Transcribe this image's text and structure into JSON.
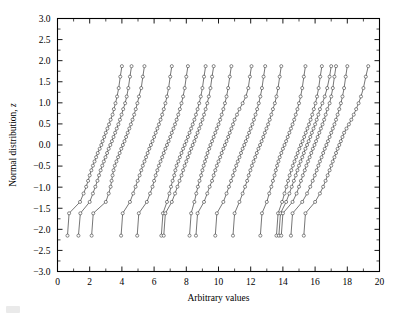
{
  "figure": {
    "name": "normal-probability-plot"
  },
  "axes": {
    "x": {
      "label": "Arbitrary values",
      "min": 0,
      "max": 20,
      "ticks": [
        0,
        2,
        4,
        6,
        8,
        10,
        12,
        14,
        16,
        18,
        20
      ],
      "tick_labels": [
        "0",
        "2",
        "4",
        "6",
        "8",
        "10",
        "12",
        "14",
        "16",
        "18",
        "20"
      ],
      "minor_tick_step": 1
    },
    "y": {
      "label_prefix": "Normal distribution, ",
      "label_symbol": "z",
      "label": "Normal distribution, z",
      "min": -3.0,
      "max": 3.0,
      "ticks": [
        -3.0,
        -2.5,
        -2.0,
        -1.5,
        -1.0,
        -0.5,
        0.0,
        0.5,
        1.0,
        1.5,
        2.0,
        2.5,
        3.0
      ],
      "tick_labels": [
        "-3.0",
        "-2.5",
        "-2.0",
        "-1.5",
        "-1.0",
        "-0.5",
        "0.0",
        "0.5",
        "1.0",
        "1.5",
        "2.0",
        "2.5",
        "3.0"
      ]
    }
  },
  "style": {
    "line_color": "#2b2b2b",
    "marker_fill": "#ffffff",
    "marker_edge": "#2b2b2b",
    "frame_color": "#000000",
    "background": "#ffffff",
    "marker": "open-circle",
    "grid": false,
    "legend": false
  },
  "chart_data": {
    "type": "line",
    "title": "",
    "subtitle": "",
    "xlabel": "Arbitrary values",
    "ylabel": "Normal distribution, z",
    "xlim": [
      0,
      20
    ],
    "ylim": [
      -3.0,
      3.0
    ],
    "grid": false,
    "legend_position": "none",
    "marker": "open-circle",
    "orientation": "quantile-vertical",
    "z_levels": [
      -2.15,
      -1.62,
      -1.35,
      -1.15,
      -0.99,
      -0.85,
      -0.72,
      -0.6,
      -0.49,
      -0.39,
      -0.29,
      -0.19,
      -0.09,
      0.0,
      0.09,
      0.19,
      0.29,
      0.39,
      0.49,
      0.6,
      0.72,
      0.85,
      0.99,
      1.15,
      1.35,
      1.62,
      1.87
    ],
    "series": [
      {
        "name": "Series 1",
        "x": [
          0.62,
          0.72,
          1.4,
          1.62,
          1.78,
          1.9,
          2.0,
          2.1,
          2.2,
          2.3,
          2.4,
          2.5,
          2.62,
          2.72,
          2.8,
          2.9,
          3.0,
          3.1,
          3.2,
          3.3,
          3.42,
          3.5,
          3.6,
          3.7,
          3.8,
          3.9,
          4.0
        ]
      },
      {
        "name": "Series 2",
        "x": [
          1.3,
          1.42,
          2.0,
          2.2,
          2.35,
          2.48,
          2.58,
          2.68,
          2.78,
          2.88,
          2.98,
          3.08,
          3.18,
          3.28,
          3.38,
          3.48,
          3.58,
          3.68,
          3.78,
          3.88,
          3.98,
          4.08,
          4.2,
          4.3,
          4.4,
          4.5,
          4.6
        ]
      },
      {
        "name": "Series 3",
        "x": [
          2.12,
          2.22,
          3.0,
          3.18,
          3.3,
          3.36,
          3.42,
          3.48,
          3.56,
          3.66,
          3.76,
          3.86,
          3.96,
          4.06,
          4.16,
          4.26,
          4.36,
          4.46,
          4.56,
          4.66,
          4.76,
          4.86,
          4.96,
          5.06,
          5.2,
          5.3,
          5.4
        ]
      },
      {
        "name": "Series 4",
        "x": [
          3.95,
          4.05,
          4.5,
          4.7,
          4.85,
          4.98,
          5.1,
          5.2,
          5.3,
          5.4,
          5.5,
          5.6,
          5.7,
          5.8,
          5.9,
          6.0,
          6.1,
          6.2,
          6.3,
          6.4,
          6.5,
          6.6,
          6.7,
          6.8,
          6.9,
          7.0,
          7.1
        ]
      },
      {
        "name": "Series 5",
        "x": [
          4.95,
          5.05,
          5.55,
          5.75,
          5.9,
          6.0,
          6.1,
          6.2,
          6.3,
          6.4,
          6.5,
          6.6,
          6.7,
          6.8,
          6.9,
          7.0,
          7.1,
          7.2,
          7.3,
          7.4,
          7.5,
          7.6,
          7.7,
          7.8,
          7.9,
          8.0,
          8.1
        ]
      },
      {
        "name": "Series 6",
        "x": [
          6.45,
          6.55,
          6.8,
          6.95,
          7.05,
          7.15,
          7.25,
          7.32,
          7.4,
          7.5,
          7.6,
          7.7,
          7.8,
          7.9,
          8.0,
          8.1,
          8.2,
          8.3,
          8.4,
          8.5,
          8.6,
          8.7,
          8.8,
          8.9,
          9.0,
          9.1,
          9.2
        ]
      },
      {
        "name": "Series 7",
        "x": [
          6.6,
          6.7,
          7.1,
          7.3,
          7.45,
          7.58,
          7.7,
          7.8,
          7.9,
          8.0,
          8.1,
          8.2,
          8.3,
          8.4,
          8.5,
          8.6,
          8.7,
          8.8,
          8.9,
          9.0,
          9.1,
          9.2,
          9.3,
          9.4,
          9.5,
          9.6,
          9.7
        ]
      },
      {
        "name": "Series 8",
        "x": [
          8.2,
          8.3,
          8.5,
          8.62,
          8.72,
          8.82,
          8.92,
          9.0,
          9.08,
          9.16,
          9.24,
          9.32,
          9.42,
          9.5,
          9.6,
          9.7,
          9.8,
          9.9,
          10.0,
          10.1,
          10.2,
          10.3,
          10.4,
          10.5,
          10.6,
          10.7,
          10.8
        ]
      },
      {
        "name": "Series 9",
        "x": [
          8.6,
          8.7,
          9.1,
          9.3,
          9.45,
          9.6,
          9.7,
          9.8,
          9.9,
          10.0,
          10.1,
          10.2,
          10.3,
          10.4,
          10.5,
          10.6,
          10.7,
          10.8,
          10.9,
          11.0,
          11.15,
          11.3,
          11.5,
          11.7,
          11.85,
          11.95,
          12.05
        ]
      },
      {
        "name": "Series 10",
        "x": [
          9.8,
          9.9,
          10.3,
          10.5,
          10.65,
          10.78,
          10.9,
          11.0,
          11.1,
          11.2,
          11.3,
          11.4,
          11.5,
          11.6,
          11.7,
          11.8,
          11.9,
          12.0,
          12.1,
          12.2,
          12.3,
          12.4,
          12.5,
          12.6,
          12.7,
          12.8,
          12.9
        ]
      },
      {
        "name": "Series 11",
        "x": [
          10.9,
          11.0,
          11.3,
          11.5,
          11.65,
          11.78,
          11.88,
          11.98,
          12.08,
          12.18,
          12.28,
          12.38,
          12.48,
          12.58,
          12.68,
          12.78,
          12.88,
          12.98,
          13.08,
          13.18,
          13.28,
          13.38,
          13.5,
          13.6,
          13.7,
          13.8,
          13.9
        ]
      },
      {
        "name": "Series 12",
        "x": [
          12.6,
          12.7,
          13.0,
          13.15,
          13.28,
          13.38,
          13.48,
          13.56,
          13.64,
          13.72,
          13.8,
          13.9,
          14.0,
          14.1,
          14.2,
          14.3,
          14.4,
          14.5,
          14.6,
          14.7,
          14.8,
          14.9,
          15.0,
          15.1,
          15.2,
          15.3,
          15.4
        ]
      },
      {
        "name": "Series 13",
        "x": [
          13.6,
          13.7,
          13.95,
          14.1,
          14.22,
          14.32,
          14.42,
          14.52,
          14.62,
          14.72,
          14.82,
          14.92,
          15.02,
          15.12,
          15.22,
          15.32,
          15.42,
          15.52,
          15.62,
          15.72,
          15.82,
          15.92,
          16.02,
          16.12,
          16.22,
          16.32,
          16.42
        ]
      },
      {
        "name": "Series 14",
        "x": [
          13.75,
          13.85,
          14.2,
          14.4,
          14.55,
          14.68,
          14.8,
          14.9,
          15.0,
          15.1,
          15.2,
          15.3,
          15.4,
          15.5,
          15.6,
          15.7,
          15.8,
          15.9,
          16.0,
          16.1,
          16.2,
          16.3,
          16.45,
          16.6,
          16.75,
          16.9,
          17.0
        ]
      },
      {
        "name": "Series 15",
        "x": [
          13.9,
          14.0,
          14.6,
          14.85,
          15.0,
          15.12,
          15.24,
          15.36,
          15.46,
          15.56,
          15.66,
          15.76,
          15.86,
          15.96,
          16.06,
          16.16,
          16.26,
          16.36,
          16.46,
          16.56,
          16.66,
          16.76,
          16.9,
          17.0,
          17.1,
          17.2,
          17.3
        ]
      },
      {
        "name": "Series 16",
        "x": [
          14.5,
          14.6,
          15.2,
          15.5,
          15.7,
          15.85,
          15.98,
          16.1,
          16.2,
          16.3,
          16.4,
          16.5,
          16.6,
          16.7,
          16.8,
          16.9,
          17.0,
          17.1,
          17.2,
          17.3,
          17.4,
          17.5,
          17.6,
          17.7,
          17.8,
          17.9,
          18.0
        ]
      },
      {
        "name": "Series 17",
        "x": [
          15.3,
          15.4,
          16.0,
          16.3,
          16.5,
          16.65,
          16.78,
          16.9,
          17.0,
          17.1,
          17.2,
          17.3,
          17.4,
          17.5,
          17.6,
          17.7,
          17.8,
          17.95,
          18.1,
          18.25,
          18.4,
          18.55,
          18.7,
          18.85,
          19.0,
          19.15,
          19.3
        ]
      }
    ]
  }
}
